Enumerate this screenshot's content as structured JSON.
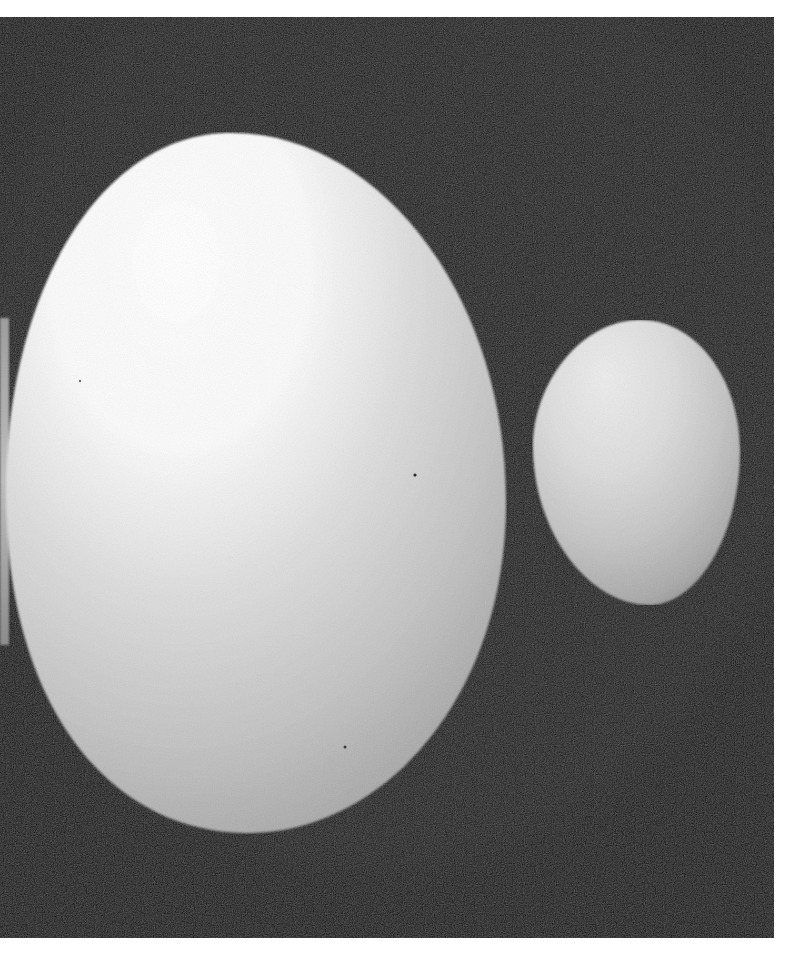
{
  "image": {
    "description": "Black-and-white photograph of a large white egg beside a smaller white egg against a dark background",
    "page_background": "#ffffff",
    "frame": {
      "x": 0,
      "y": 17,
      "width": 774,
      "height": 921,
      "color": "#141414"
    },
    "subjects": [
      {
        "name": "large-egg",
        "center": [
          255,
          483
        ],
        "width": 500,
        "height": 700,
        "highlight": "#ffffff",
        "shadow": "#a6a6a6"
      },
      {
        "name": "small-egg",
        "center": [
          637,
          462
        ],
        "width": 207,
        "height": 285,
        "highlight": "#e6e6e6",
        "shadow": "#8e8e8e"
      },
      {
        "name": "partial-egg-left-edge",
        "x": 0,
        "y": 318,
        "width": 8,
        "height": 327,
        "color": "#b4b4b4"
      }
    ],
    "specks": [
      {
        "x": 415,
        "y": 475
      },
      {
        "x": 345,
        "y": 747
      },
      {
        "x": 80,
        "y": 381
      }
    ]
  }
}
